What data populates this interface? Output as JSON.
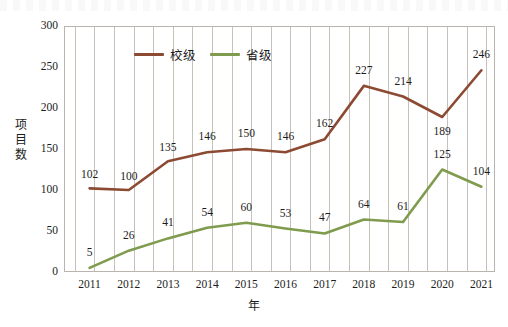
{
  "chart_data": {
    "type": "line",
    "title": "",
    "xlabel": "年",
    "ylabel": "项目数",
    "categories": [
      "2011",
      "2012",
      "2013",
      "2014",
      "2015",
      "2016",
      "2017",
      "2018",
      "2019",
      "2020",
      "2021"
    ],
    "ylim": [
      0,
      300
    ],
    "yticks": [
      "0",
      "50",
      "100",
      "150",
      "200",
      "250",
      "300"
    ],
    "grid": "vertical-minor",
    "legend_position": "top-center-inside",
    "series": [
      {
        "name": "校级",
        "color": "#8d4a33",
        "values": [
          102,
          100,
          135,
          146,
          150,
          146,
          162,
          227,
          214,
          189,
          246
        ]
      },
      {
        "name": "省级",
        "color": "#7f9b4d",
        "values": [
          5,
          26,
          41,
          54,
          60,
          53,
          47,
          64,
          61,
          125,
          104
        ]
      }
    ]
  },
  "axis": {
    "y_title": "项目数",
    "y_title_chars": [
      "项",
      "目",
      "数"
    ],
    "x_title": "年"
  },
  "colors": {
    "school_level": "#8d4a33",
    "province_level": "#7f9b4d",
    "grid": "#c6c2ba",
    "frame": "#b9b5ae",
    "text": "#1c1c1c",
    "background": "#ffffff"
  }
}
